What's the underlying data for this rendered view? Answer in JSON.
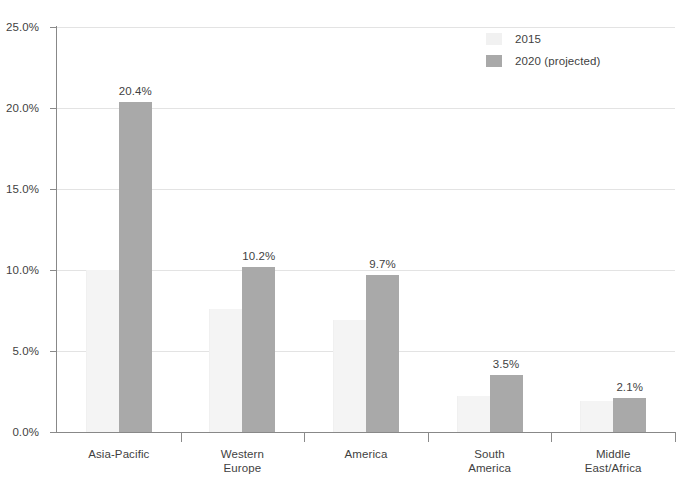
{
  "chart_data": {
    "type": "bar",
    "title": "",
    "subtitle": "",
    "xlabel": "",
    "ylabel": "",
    "ylim": [
      0,
      25
    ],
    "ytick_labels": [
      "25.0%",
      "20.0%",
      "15.0%",
      "10.0%",
      "5.0%",
      "0.0%"
    ],
    "ytick_values": [
      25,
      20,
      15,
      10,
      5,
      0
    ],
    "grid": true,
    "legend_position": "top-right",
    "categories": [
      "Asia-Pacific",
      "Western\nEurope",
      "America",
      "South\nAmerica",
      "Middle\nEast/Africa"
    ],
    "series": [
      {
        "name": "2015",
        "color": "#f4f4f4",
        "values": [
          10.0,
          7.6,
          6.9,
          2.2,
          1.9
        ],
        "labels": [
          "",
          "",
          "",
          "",
          ""
        ]
      },
      {
        "name": "2020 (projected)",
        "color": "#a9a9a9",
        "values": [
          20.4,
          10.2,
          9.7,
          3.5,
          2.1
        ],
        "labels": [
          "20.4%",
          "10.2%",
          "9.7%",
          "3.5%",
          "2.1%"
        ]
      }
    ]
  },
  "legend": {
    "items": [
      {
        "label": "2015",
        "swatch": "light-swatch-icon"
      },
      {
        "label": "2020 (projected)",
        "swatch": "gray-swatch-icon"
      }
    ]
  },
  "colors": {
    "series_2015": "#f4f4f4",
    "series_2020": "#a9a9a9",
    "axis": "#888888",
    "gridline": "#e3e3e3",
    "text": "#3f3f3f",
    "background": "#ffffff"
  }
}
